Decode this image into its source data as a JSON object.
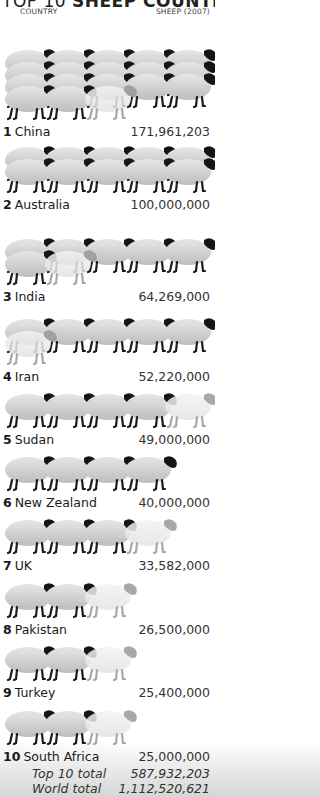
{
  "title": {
    "prefix": "TOP 10",
    "bold": "SHEEP COUNTRIES"
  },
  "headers": {
    "country": "COUNTRY",
    "sheep": "SHEEP (2007)"
  },
  "rows": [
    {
      "rank": "1",
      "country": "China",
      "value": "171,961,203",
      "y": 124,
      "flock_top": 20,
      "rows_of_sheep": [
        5,
        5,
        5,
        2
      ],
      "label_y": 124
    },
    {
      "rank": "2",
      "country": "Australia",
      "value": "100,000,000",
      "y": 197
    },
    {
      "rank": "3",
      "country": "India",
      "value": "64,269,000",
      "y": 289
    },
    {
      "rank": "4",
      "country": "Iran",
      "value": "52,220,000",
      "y": 369
    },
    {
      "rank": "5",
      "country": "Sudan",
      "value": "49,000,000",
      "y": 432
    },
    {
      "rank": "6",
      "country": "New Zealand",
      "value": "40,000,000",
      "y": 495
    },
    {
      "rank": "7",
      "country": "UK",
      "value": "33,582,000",
      "y": 558
    },
    {
      "rank": "8",
      "country": "Pakistan",
      "value": "26,500,000",
      "y": 622
    },
    {
      "rank": "9",
      "country": "Turkey",
      "value": "25,400,000",
      "y": 685
    },
    {
      "rank": "10",
      "country": "South Africa",
      "value": "25,000,000",
      "y": 749
    }
  ],
  "totals": [
    {
      "label": "Top 10 total",
      "value": "587,932,203"
    },
    {
      "label": "World total",
      "value": "1,112,520,621"
    }
  ],
  "chart_data": {
    "type": "bar",
    "title": "TOP 10 SHEEP COUNTRIES",
    "xlabel": "COUNTRY",
    "ylabel": "SHEEP (2007)",
    "categories": [
      "China",
      "Australia",
      "India",
      "Iran",
      "Sudan",
      "New Zealand",
      "UK",
      "Pakistan",
      "Turkey",
      "South Africa"
    ],
    "values": [
      171961203,
      100000000,
      64269000,
      52220000,
      49000000,
      40000000,
      33582000,
      26500000,
      25400000,
      25000000
    ],
    "pictogram_unit": "1 sheep icon ≈ 10,000,000 sheep",
    "orientation": "horizontal pictogram",
    "annotations": [
      {
        "label": "Top 10 total",
        "value": 587932203
      },
      {
        "label": "World total",
        "value": 1112520621
      }
    ]
  }
}
